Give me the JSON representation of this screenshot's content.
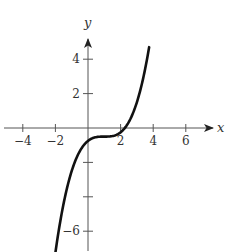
{
  "chart_data": {
    "type": "line",
    "title": "",
    "xlabel": "x",
    "ylabel": "y",
    "xlim": [
      -4.5,
      7
    ],
    "ylim": [
      -7,
      5.5
    ],
    "grid": false,
    "legend": null,
    "x_ticks": [
      -4,
      -2,
      2,
      4,
      6
    ],
    "x_tick_labels": [
      "−4",
      "−2",
      "2",
      "4",
      "6"
    ],
    "y_ticks": [
      -6,
      -4,
      -2,
      2,
      4
    ],
    "y_tick_labels": [
      "−6",
      "",
      "",
      "2",
      "4"
    ],
    "series": [
      {
        "name": "f(x)",
        "description": "cubic curve with horizontal inflection plateau near (1, -0.5)",
        "x": [
          -2.0,
          -1.5,
          -1.0,
          -0.5,
          0.0,
          0.5,
          1.0,
          1.5,
          2.0,
          2.5,
          3.0,
          3.5,
          3.75
        ],
        "y": [
          -7.25,
          -4.4,
          -2.5,
          -1.34,
          -0.75,
          -0.53,
          -0.5,
          -0.47,
          -0.25,
          0.34,
          1.5,
          3.4,
          4.7
        ],
        "color": "#111111"
      }
    ]
  },
  "axes": {
    "x_label": "x",
    "y_label": "y"
  }
}
